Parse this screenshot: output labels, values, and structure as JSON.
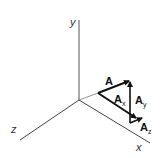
{
  "diagram": {
    "type": "3d-vector-components",
    "axes": {
      "x": {
        "label": "x"
      },
      "y": {
        "label": "y"
      },
      "z": {
        "label": "z"
      }
    },
    "vectors": {
      "A": {
        "label": "A"
      },
      "Ax": {
        "label": "A",
        "sub": "x"
      },
      "Ay": {
        "label": "A",
        "sub": "y"
      },
      "Az": {
        "label": "A",
        "sub": "z"
      }
    },
    "colors": {
      "axis": "#555555",
      "vector": "#111111",
      "background": "#ffffff"
    }
  }
}
